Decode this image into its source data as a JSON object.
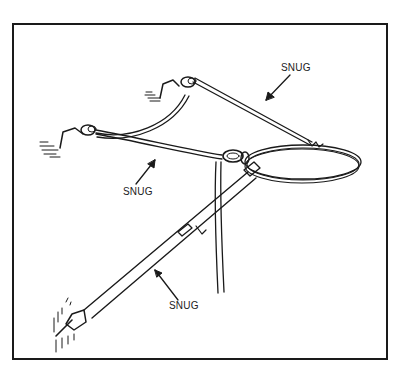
{
  "figure": {
    "labels": [
      {
        "id": "top-right",
        "text": "SNUG"
      },
      {
        "id": "middle-left",
        "text": "SNUG"
      },
      {
        "id": "bottom",
        "text": "SNUG"
      }
    ],
    "colors": {
      "line": "#1a1a1a",
      "background": "#ffffff",
      "frame": "#1a1a1a"
    }
  }
}
